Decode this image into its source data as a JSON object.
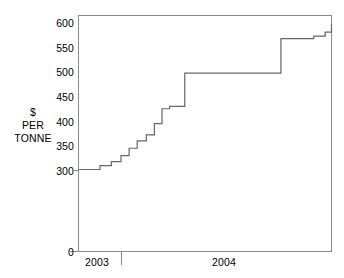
{
  "chart_data": {
    "type": "line",
    "subtype": "step",
    "title": "",
    "xlabel": "",
    "ylabel": "$ PER TONNE",
    "ylabel_lines": [
      "$",
      "PER",
      "TONNE"
    ],
    "yticks": [
      0,
      300,
      350,
      400,
      450,
      500,
      550,
      600
    ],
    "ytick_labels": [
      "0",
      "300",
      "350",
      "400",
      "450",
      "500",
      "550",
      "600"
    ],
    "ylim": [
      300,
      610
    ],
    "y_axis_broken": true,
    "y_axis_break_note": "axis jumps from 0 to 300",
    "xticks": [
      "2003",
      "2004"
    ],
    "xtick_labels": [
      "2003",
      "2004"
    ],
    "x_boundary_tick_fraction": 0.169,
    "grid": false,
    "legend": null,
    "line_color": "#666666",
    "axis_color": "#8a8a8a",
    "series": [
      {
        "name": "price",
        "x": [
          0.0,
          0.04,
          0.085,
          0.13,
          0.168,
          0.2,
          0.232,
          0.268,
          0.3,
          0.33,
          0.36,
          0.39,
          0.42,
          0.52,
          0.8,
          0.845,
          0.93,
          0.975,
          1.0
        ],
        "values": [
          302,
          302,
          310,
          318,
          330,
          345,
          360,
          372,
          395,
          425,
          430,
          430,
          497,
          497,
          567,
          567,
          572,
          580,
          597
        ]
      }
    ]
  },
  "axis": {
    "y_title_line1": "$",
    "y_title_line2": "PER",
    "y_title_line3": "TONNE"
  }
}
